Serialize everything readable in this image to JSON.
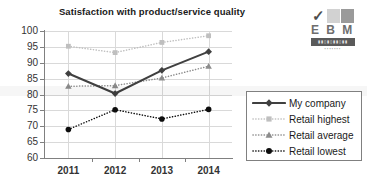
{
  "chart_data": {
    "type": "line",
    "title": "Satisfaction with product/service quality",
    "xlabel": "",
    "ylabel": "",
    "categories": [
      "2011",
      "2012",
      "2013",
      "2014"
    ],
    "ylim": [
      60,
      100
    ],
    "ytick_step": 5,
    "yticks": [
      "100",
      "95",
      "90",
      "85",
      "80",
      "75",
      "70",
      "65",
      "60"
    ],
    "grid": true,
    "legend_position": "right",
    "series": [
      {
        "name": "My company",
        "values": [
          86.6,
          80.3,
          87.6,
          93.5
        ],
        "color": "#404040",
        "marker": "diamond",
        "line_style": "solid"
      },
      {
        "name": "Retail highest",
        "values": [
          95.2,
          93.2,
          96.4,
          98.5
        ],
        "color": "#bfbfbf",
        "marker": "square",
        "line_style": "dotted"
      },
      {
        "name": "Retail average",
        "values": [
          82.6,
          82.8,
          85.2,
          88.9
        ],
        "color": "#8c8c8c",
        "marker": "triangle",
        "line_style": "dotted"
      },
      {
        "name": "Retail lowest",
        "values": [
          69.0,
          75.2,
          72.3,
          75.3
        ],
        "color": "#0d0d0d",
        "marker": "circle",
        "line_style": "dotted"
      }
    ]
  },
  "logo": {
    "check_glyph": "✓",
    "name": "E B M",
    "bar_text": "▮▮▯▮▯▮▮▯▮▮",
    "sub_text": "▪▪▪▪▪▪▪"
  },
  "colors": {
    "axis": "#808080",
    "gridline": "#d9d9d9",
    "text": "#333333",
    "title": "#1a1a1a",
    "background": "#ffffff"
  }
}
